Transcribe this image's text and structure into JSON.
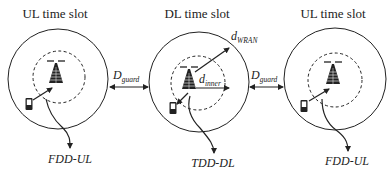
{
  "diagram": {
    "titles": {
      "left": "UL time slot",
      "middle": "DL time slot",
      "right": "UL time slot"
    },
    "guard_labels": {
      "main": "D",
      "sub": "guard"
    },
    "radius_labels": {
      "outer_main": "d",
      "outer_sub": "WRAN",
      "inner_main": "d",
      "inner_sub": "inner"
    },
    "link_labels": {
      "left": "FDD-UL",
      "middle": "TDD-DL",
      "right": "FDD-UL"
    },
    "colors": {
      "stroke": "#222222",
      "background": "#ffffff"
    }
  }
}
